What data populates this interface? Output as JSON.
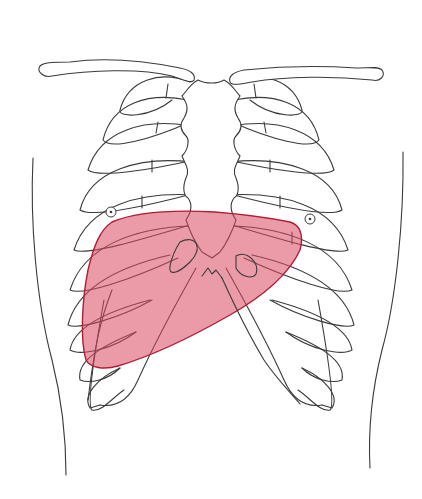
{
  "figure": {
    "title": "Anterior thorax with liver projection",
    "alt": "Line drawing of the anterior rib cage, clavicles and sternum with the liver region shaded in red",
    "regions": [
      {
        "name": "clavicles",
        "type": "outline"
      },
      {
        "name": "sternum",
        "type": "outline"
      },
      {
        "name": "rib-cage",
        "type": "outline"
      },
      {
        "name": "nipples",
        "type": "marker",
        "count": 2
      },
      {
        "name": "body-contour",
        "type": "outline"
      },
      {
        "name": "liver",
        "type": "shaded-area"
      }
    ]
  },
  "colors": {
    "background": "#ffffff",
    "line": "#3a3a3a",
    "liver_fill": "#d9485f",
    "liver_fill_opacity": "0.55",
    "liver_stroke": "#b01e34"
  }
}
